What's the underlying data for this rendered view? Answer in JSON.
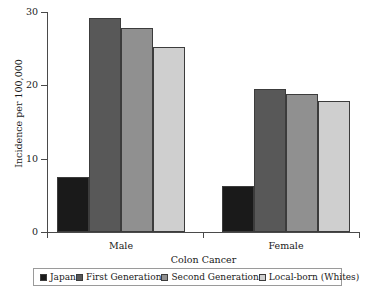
{
  "chart_data": {
    "type": "bar",
    "title": "",
    "xlabel": "Colon Cancer",
    "ylabel": "Incidence per 100,000",
    "categories": [
      "Male",
      "Female"
    ],
    "series": [
      {
        "name": "Japan",
        "color": "#1a1a1a",
        "values": [
          7.5,
          6.3
        ]
      },
      {
        "name": "First Generation",
        "color": "#585858",
        "values": [
          29.2,
          19.5
        ]
      },
      {
        "name": "Second Generation",
        "color": "#909090",
        "values": [
          27.8,
          18.8
        ]
      },
      {
        "name": "Local-born (Whites)",
        "color": "#cfcfcf",
        "values": [
          25.2,
          17.9
        ]
      }
    ],
    "ylim": [
      0,
      30
    ],
    "yticks": [
      0,
      10,
      20,
      30
    ],
    "ytick_labels": [
      "0",
      "10",
      "20",
      "30"
    ],
    "grid": false,
    "legend_position": "bottom"
  },
  "axes": {
    "y_title": "Incidence per 100,000",
    "x_title": "Colon Cancer",
    "y_tick_0": "0",
    "y_tick_1": "10",
    "y_tick_2": "20",
    "y_tick_3": "30",
    "x_group_0": "Male",
    "x_group_1": "Female"
  },
  "legend": {
    "items": [
      {
        "label": "Japan",
        "swatch": "#1a1a1a"
      },
      {
        "label": "First Generation",
        "swatch": "#585858"
      },
      {
        "label": "Second Generation",
        "swatch": "#909090"
      },
      {
        "label": "Local-born (Whites)",
        "swatch": "#cfcfcf"
      }
    ]
  }
}
